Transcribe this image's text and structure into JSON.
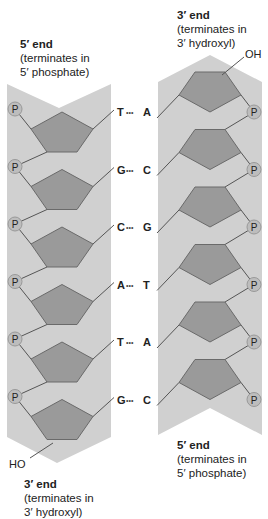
{
  "labels": {
    "top_left": {
      "title": "5′ end",
      "line1": "(terminates in",
      "line2": "5′ phosphate)"
    },
    "top_right": {
      "title": "3′ end",
      "line1": "(terminates in",
      "line2": "3′ hydroxyl)"
    },
    "bottom_left": {
      "title": "3′ end",
      "line1": "(terminates in",
      "line2": "3′ hydroxyl)"
    },
    "bottom_right": {
      "title": "5′ end",
      "line1": "(terminates in",
      "line2": "5′ phosphate)"
    }
  },
  "terminals": {
    "oh_top_right": "OH",
    "ho_bottom_left": "HO"
  },
  "phosphate_symbol": "P",
  "base_pairs": [
    {
      "left": "T",
      "dots": "•••",
      "right": "A"
    },
    {
      "left": "G",
      "dots": "•••",
      "right": "C"
    },
    {
      "left": "C",
      "dots": "•••",
      "right": "G"
    },
    {
      "left": "A",
      "dots": "•••",
      "right": "T"
    },
    {
      "left": "T",
      "dots": "•••",
      "right": "A"
    },
    {
      "left": "G",
      "dots": "•••",
      "right": "C"
    }
  ],
  "colors": {
    "strand_bg": "#d0d0d0",
    "sugar_fill": "#9a9a9a",
    "sugar_stroke": "#6a6a6a",
    "phosphate_fill": "#bdbdbd",
    "line": "#555555",
    "text": "#222222"
  }
}
